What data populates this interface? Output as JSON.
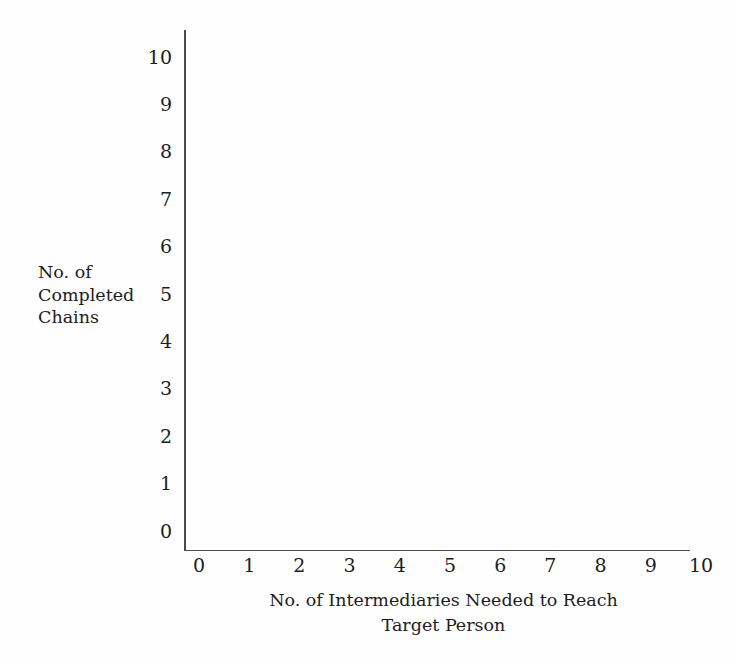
{
  "chart_data": {
    "type": "scatter",
    "title": "",
    "subtitle": "",
    "xlabel": "No. of Intermediaries Needed to Reach\nTarget Person",
    "ylabel": "No. of\nCompleted\nChains",
    "xlim": [
      0,
      10
    ],
    "ylim": [
      0,
      10
    ],
    "x_ticks": [
      "0",
      "1",
      "2",
      "3",
      "4",
      "5",
      "6",
      "7",
      "8",
      "9",
      "10"
    ],
    "y_ticks": [
      "10",
      "9",
      "8",
      "7",
      "6",
      "5",
      "4",
      "3",
      "2",
      "1",
      "0"
    ],
    "x_tick_values": [
      0,
      1,
      2,
      3,
      4,
      5,
      6,
      7,
      8,
      9,
      10
    ],
    "y_tick_values": [
      10,
      9,
      8,
      7,
      6,
      5,
      4,
      3,
      2,
      1,
      0
    ],
    "grid": false,
    "legend": null,
    "legend_position": "none",
    "series": [],
    "values": [],
    "annotations": [],
    "note": "Empty plot area - no data points, bars, or lines are drawn"
  },
  "axes": {
    "line_color": "#4a4a4a",
    "spines": "left-and-bottom",
    "tick_marks": "none"
  },
  "colors": {
    "background": "#fefefe",
    "text": "#1d1d1d",
    "axis": "#4a4a4a"
  }
}
